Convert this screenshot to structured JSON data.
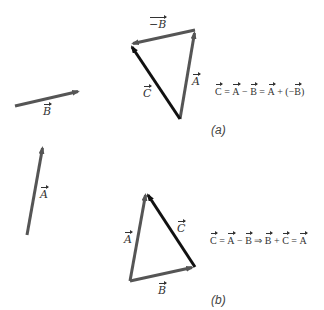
{
  "colors": {
    "vector_gray": "#555555",
    "vector_black": "#111111",
    "text": "#333333"
  },
  "left_vectors": {
    "B": {
      "label": "B",
      "from": [
        15,
        106
      ],
      "to": [
        80,
        91
      ]
    },
    "A": {
      "label": "A",
      "from": [
        27,
        235
      ],
      "to": [
        43,
        145
      ]
    }
  },
  "panel_a": {
    "caption": "(a)",
    "vectors": {
      "A": {
        "label": "A",
        "from": [
          180,
          119
        ],
        "to": [
          195,
          30
        ]
      },
      "negB": {
        "label": "−B",
        "from": [
          195,
          30
        ],
        "to": [
          130,
          44
        ]
      },
      "C": {
        "label": "C",
        "from": [
          180,
          119
        ],
        "to": [
          130,
          44
        ]
      }
    },
    "equation": {
      "C": "C",
      "eq1": " = ",
      "A1": "A",
      "minus": " − ",
      "B1": "B",
      "eq2": " = ",
      "A2": "A",
      "plus": " + (−",
      "B2": "B",
      "close": ")"
    }
  },
  "panel_b": {
    "caption": "(b)",
    "vectors": {
      "A": {
        "label": "A",
        "from": [
          130,
          281
        ],
        "to": [
          146,
          192
        ]
      },
      "B": {
        "label": "B",
        "from": [
          130,
          281
        ],
        "to": [
          195,
          267
        ]
      },
      "C": {
        "label": "C",
        "from": [
          195,
          267
        ],
        "to": [
          146,
          192
        ]
      }
    },
    "equation": {
      "C": "C",
      "eq1": " = ",
      "A1": "A",
      "minus": " − ",
      "B1": "B",
      "implies": " ⇒ ",
      "B2": "B",
      "plus": " + ",
      "C2": "C",
      "eq2": " = ",
      "A2": "A"
    }
  }
}
